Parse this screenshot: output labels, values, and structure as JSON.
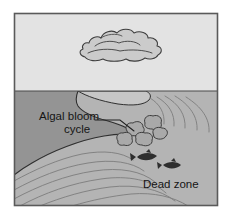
{
  "figure": {
    "kind": "illustration",
    "panels": [
      {
        "name": "sky-panel",
        "description": "light sky with a single cloud"
      },
      {
        "name": "water-panel",
        "description": "water surface with algal bloom plume, algae clumps, dead fish"
      }
    ]
  },
  "labels": {
    "algal_bloom_line1": "Algal bloom",
    "algal_bloom_line2": "cycle",
    "dead_zone": "Dead zone"
  },
  "colors": {
    "outer_background": "#ffffff",
    "frame_border": "#5a5a5a",
    "sky_fill": "#e3e3e3",
    "water_fill": "#b4b4b4",
    "bloom_fill": "#949494",
    "cloud_fill": "#cbcbcb",
    "cloud_outline": "#3d3d3d",
    "algae_fill": "#a9a9a9",
    "algae_outline": "#3d3d3d",
    "fish_fill": "#2e2e2e",
    "current_line": "#7f7f7f",
    "leader_line": "#202020",
    "text": "#151515"
  },
  "geometry": {
    "frame": {
      "x": 14,
      "y": 13,
      "width": 204,
      "height": 193
    },
    "horizon_y": 91
  },
  "elements": {
    "cloud": {
      "name": "cloud",
      "cx": 117,
      "cy": 43
    },
    "algae_clump_count": 5,
    "fish_count": 2,
    "current_line_count": 11
  }
}
